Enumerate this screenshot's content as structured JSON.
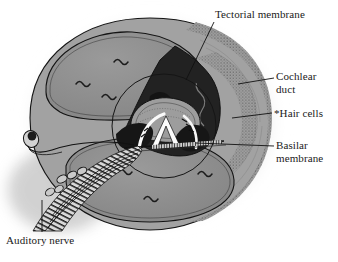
{
  "figure": {
    "background_color": "#ffffff",
    "width": 338,
    "height": 262
  },
  "labels": [
    {
      "id": "tectorial",
      "name": "tectorial-membrane-label",
      "lines": [
        "Tectorial membrane"
      ],
      "text": "Tectorial membrane"
    },
    {
      "id": "cochlear",
      "name": "cochlear-duct-label",
      "lines": [
        "Cochlear",
        "duct"
      ],
      "line1": "Cochlear",
      "line2": "duct"
    },
    {
      "id": "hair",
      "name": "hair-cells-label",
      "lines": [
        "*Hair cells"
      ],
      "text": "*Hair cells"
    },
    {
      "id": "basilar",
      "name": "basilar-membrane-label",
      "lines": [
        "Basilar",
        "membrane"
      ],
      "line1": "Basilar",
      "line2": "membrane"
    },
    {
      "id": "auditory",
      "name": "auditory-nerve-label",
      "lines": [
        "Auditory nerve"
      ],
      "text": "Auditory nerve"
    }
  ],
  "colors": {
    "ink": "#1a1a1a",
    "outline": "#111111",
    "chamber_fill": "#8e8e8e",
    "duct_dark": "#1d1d1d",
    "bone_fill": "#a8a8a8",
    "bone_stipple": "#6d6d6d",
    "halo": "#9a9a9a",
    "tunnel_white": "#fbfbfb",
    "nerve_fill": "#cfcfcf",
    "leader": "#111111",
    "background": "#ffffff"
  },
  "structures": {
    "scala_vestibuli": "upper-chamber",
    "scala_tympani": "lower-chamber",
    "cochlear_duct": "dark-triangular-duct",
    "organ_of_corti": "central-tunnel",
    "stria_vascularis": "stippled-outer-wall",
    "spiral_ganglion": "nerve-root-bulb",
    "nerve_fibers": "striped-fiber-bundle"
  }
}
